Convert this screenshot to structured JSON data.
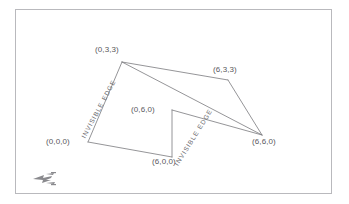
{
  "figure": {
    "type": "wireframe-3d-diagram",
    "background_color": "#ffffff",
    "frame_color": "#b9b9bd",
    "line_color": "#7a7a7e",
    "label_color": "#58585c",
    "edge_label_color": "#6a6a6e",
    "logo_name": "publisher-logo-watermark"
  },
  "vertices": [
    {
      "id": "v_0_3_3",
      "label": "(0,3,3)",
      "x": 122,
      "y": 62,
      "label_x": 95,
      "label_y": 45
    },
    {
      "id": "v_6_3_3",
      "label": "(6,3,3)",
      "x": 228,
      "y": 80,
      "label_x": 213,
      "label_y": 65
    },
    {
      "id": "v_0_6_0",
      "label": "(0,6,0)",
      "x": 172,
      "y": 110,
      "label_x": 131,
      "label_y": 105
    },
    {
      "id": "v_6_6_0",
      "label": "(6,6,0)",
      "x": 262,
      "y": 135,
      "label_x": 252,
      "label_y": 137
    },
    {
      "id": "v_0_0_0",
      "label": "(0,0,0)",
      "x": 88,
      "y": 142,
      "label_x": 46,
      "label_y": 137
    },
    {
      "id": "v_6_0_0",
      "label": "(6,0,0)",
      "x": 172,
      "y": 157,
      "label_x": 152,
      "label_y": 157
    }
  ],
  "edges": [
    {
      "id": "e_top_ridge",
      "from": "v_0_3_3",
      "to": "v_6_3_3",
      "style": "solid"
    },
    {
      "id": "e_left_slope",
      "from": "v_0_3_3",
      "to": "v_6_6_0",
      "style": "solid"
    },
    {
      "id": "e_right_slope",
      "from": "v_6_3_3",
      "to": "v_6_6_0",
      "style": "solid"
    },
    {
      "id": "e_mid_to_right",
      "from": "v_0_6_0",
      "to": "v_6_6_0",
      "style": "solid"
    },
    {
      "id": "e_bottom_front",
      "from": "v_0_0_0",
      "to": "v_6_0_0",
      "style": "solid"
    },
    {
      "id": "e_hidden_left",
      "from": "v_0_0_0",
      "to": "v_0_3_3",
      "style": "solid",
      "note": "invisible edge"
    },
    {
      "id": "e_hidden_mid",
      "from": "v_6_0_0",
      "to": "v_0_6_0",
      "style": "solid",
      "note": "invisible edge"
    }
  ],
  "edge_labels": [
    {
      "id": "invisible_edge_left",
      "text": "INVISIBLE EDGE",
      "x": 80,
      "y": 136,
      "rotation": -62
    },
    {
      "id": "invisible_edge_right",
      "text": "INVISIBLE EDGE",
      "x": 173,
      "y": 163,
      "rotation": -58
    }
  ],
  "chart_data": {
    "type": "scatter",
    "title": "",
    "xlabel": "",
    "ylabel": "",
    "points": [
      {
        "label": "(0,3,3)",
        "coords": [
          0,
          3,
          3
        ]
      },
      {
        "label": "(6,3,3)",
        "coords": [
          6,
          3,
          3
        ]
      },
      {
        "label": "(0,6,0)",
        "coords": [
          0,
          6,
          0
        ]
      },
      {
        "label": "(6,6,0)",
        "coords": [
          6,
          6,
          0
        ]
      },
      {
        "label": "(0,0,0)",
        "coords": [
          0,
          0,
          0
        ]
      },
      {
        "label": "(6,0,0)",
        "coords": [
          6,
          0,
          0
        ]
      }
    ],
    "annotations": [
      "INVISIBLE EDGE",
      "INVISIBLE EDGE"
    ]
  }
}
